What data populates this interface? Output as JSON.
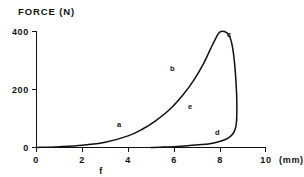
{
  "chart_data": {
    "type": "line",
    "title": "",
    "ylabel": "FORCE (N)",
    "xlabel": "f",
    "xunit": "(mm)",
    "xlim": [
      0,
      10
    ],
    "ylim": [
      0,
      400
    ],
    "grid": false,
    "legend": "none",
    "y_ticks": [
      "0",
      "200",
      "400"
    ],
    "y_tick_values": [
      0,
      200,
      400
    ],
    "x_ticks": [
      "0",
      "2",
      "4",
      "6",
      "8",
      "10"
    ],
    "x_tick_values": [
      0,
      2,
      4,
      6,
      8,
      10
    ],
    "annotations": [
      {
        "text": "a",
        "x": 4.6,
        "y": 85
      },
      {
        "text": "b",
        "x": 6.9,
        "y": 272
      },
      {
        "text": "c",
        "x": 9.4,
        "y": 389
      },
      {
        "text": "d",
        "x": 8.0,
        "y": 52
      },
      {
        "text": "e",
        "x": 6.8,
        "y": 145
      },
      {
        "text": "f",
        "x": 2.8,
        "y": -80
      }
    ],
    "series": [
      {
        "name": "loading-curve",
        "description": "Rising force-displacement loading branch through a and b to peak c, then steep drop",
        "points": [
          [
            0.0,
            0
          ],
          [
            1.0,
            3
          ],
          [
            2.0,
            8
          ],
          [
            3.0,
            18
          ],
          [
            4.0,
            40
          ],
          [
            4.6,
            62
          ],
          [
            5.2,
            92
          ],
          [
            5.8,
            130
          ],
          [
            6.4,
            182
          ],
          [
            6.9,
            236
          ],
          [
            7.3,
            290
          ],
          [
            7.6,
            340
          ],
          [
            7.85,
            380
          ],
          [
            8.0,
            398
          ],
          [
            8.2,
            400
          ],
          [
            8.4,
            388
          ],
          [
            8.55,
            350
          ],
          [
            8.65,
            290
          ],
          [
            8.72,
            215
          ],
          [
            8.75,
            150
          ],
          [
            8.74,
            95
          ]
        ]
      },
      {
        "name": "unloading-curve",
        "description": "Lower unloading branch d returning toward the displacement axis",
        "points": [
          [
            8.74,
            95
          ],
          [
            8.7,
            70
          ],
          [
            8.6,
            50
          ],
          [
            8.4,
            34
          ],
          [
            8.1,
            23
          ],
          [
            7.7,
            15
          ],
          [
            7.2,
            10
          ],
          [
            6.6,
            6
          ],
          [
            6.0,
            3
          ],
          [
            5.4,
            1
          ],
          [
            5.0,
            0
          ]
        ]
      }
    ]
  },
  "labels": {
    "ylabel": "FORCE (N)",
    "xlabel": "f",
    "xunit": "(mm)",
    "y400": "400",
    "y200": "200",
    "y0": "0",
    "x0": "0",
    "x2": "2",
    "x4": "4",
    "x6": "6",
    "x8": "8",
    "x10": "10",
    "pa": "a",
    "pb": "b",
    "pc": "c",
    "pd": "d",
    "pe": "e"
  },
  "colors": {
    "ink": "#111111",
    "background": "#ffffff"
  }
}
